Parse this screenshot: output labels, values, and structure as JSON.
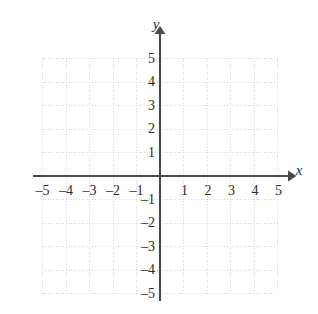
{
  "chart_data": {
    "type": "scatter",
    "title": "",
    "subtitle": "",
    "xlabel": "x",
    "ylabel": "y",
    "xlim": [
      -5,
      5
    ],
    "ylim": [
      -5,
      5
    ],
    "grid": true,
    "legend": null,
    "series": [],
    "x": [],
    "values": [],
    "annotations": [],
    "x_tick_labels": [
      "–5",
      "–4",
      "–3",
      "–2",
      "–1",
      "1",
      "2",
      "3",
      "4",
      "5"
    ],
    "x_tick_values": [
      -5,
      -4,
      -3,
      -2,
      -1,
      1,
      2,
      3,
      4,
      5
    ],
    "y_tick_labels": [
      "5",
      "4",
      "3",
      "2",
      "1",
      "–1",
      "–2",
      "–3",
      "–4",
      "–5"
    ],
    "y_tick_values": [
      5,
      4,
      3,
      2,
      1,
      -1,
      -2,
      -3,
      -4,
      -5
    ],
    "origin_label": "",
    "colors": {
      "background": "#ffffff",
      "grid": "#d8d8d8",
      "axis": "#4a4a4a",
      "text": "#2b2b2b"
    }
  },
  "axes": {
    "x_name": "x",
    "y_name": "y"
  }
}
